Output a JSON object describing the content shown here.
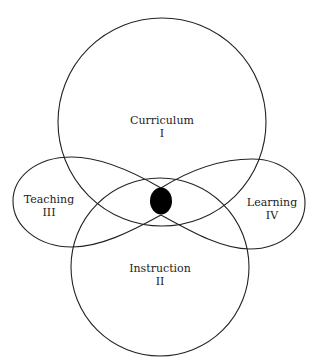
{
  "diagram": {
    "type": "overlapping-circles-with-figure-eight",
    "stroke_color": "#222222",
    "fill_center_color": "#000000",
    "regions": [
      {
        "id": "curriculum",
        "name": "Curriculum",
        "numeral": "I"
      },
      {
        "id": "instruction",
        "name": "Instruction",
        "numeral": "II"
      },
      {
        "id": "teaching",
        "name": "Teaching",
        "numeral": "III"
      },
      {
        "id": "learning",
        "name": "Learning",
        "numeral": "IV"
      }
    ],
    "center_mark": "filled-ellipse"
  }
}
